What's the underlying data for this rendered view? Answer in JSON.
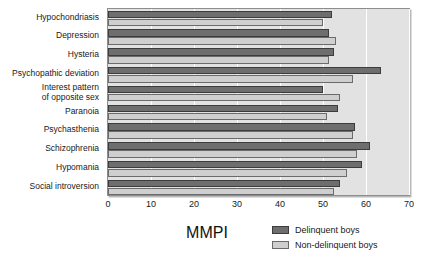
{
  "chart_data": {
    "type": "bar",
    "orientation": "horizontal",
    "title": "",
    "xlabel": "MMPI",
    "ylabel": "",
    "xlim": [
      0,
      70
    ],
    "xticks": [
      0,
      10,
      20,
      30,
      40,
      50,
      60,
      70
    ],
    "grid": "vertical-white-gridlines",
    "legend_position": "bottom-right",
    "categories": [
      "Hypochondriasis",
      "Depression",
      "Hysteria",
      "Psychopathic deviation",
      "Interest pattern\nof opposite sex",
      "Paranoia",
      "Psychasthenia",
      "Schizophrenia",
      "Hypomania",
      "Social introversion"
    ],
    "series": [
      {
        "name": "Delinquent boys",
        "color": "#6e6e6e",
        "values": [
          52,
          51.5,
          52.5,
          63.5,
          50,
          53.5,
          57.5,
          61,
          59,
          54
        ]
      },
      {
        "name": "Non-delinquent boys",
        "color": "#cfcfcf",
        "values": [
          50,
          53,
          51.5,
          57,
          54,
          51,
          57,
          58,
          55.5,
          52.5
        ]
      }
    ]
  },
  "axis": {
    "x_title": "MMPI",
    "tick_labels": [
      "0",
      "10",
      "20",
      "30",
      "40",
      "50",
      "60",
      "70"
    ]
  },
  "legend": {
    "items": [
      {
        "label": "Delinquent boys",
        "swatch": "dark-gray-swatch"
      },
      {
        "label": "Non-delinquent boys",
        "swatch": "light-gray-swatch"
      }
    ]
  }
}
